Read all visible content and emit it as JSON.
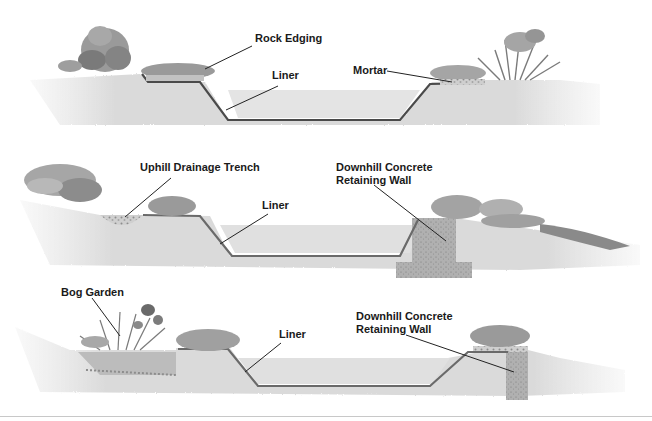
{
  "diagram": {
    "colors": {
      "soil": "#d8d8d8",
      "soil_dark": "#bdbdbd",
      "water": "#e6e6e6",
      "liner": "#4a4a4a",
      "rock": "#9a9a9a",
      "rock_light": "#b8b8b8",
      "concrete": "#a8a8a8",
      "plant": "#8a8a8a",
      "plant_dark": "#5e5e5e",
      "leader": "#222222",
      "rule": "#c8c8c8"
    },
    "panels": [
      {
        "id": "level-ground",
        "labels": [
          {
            "text": "Rock Edging"
          },
          {
            "text": "Liner"
          },
          {
            "text": "Mortar"
          }
        ]
      },
      {
        "id": "sloped-with-trench",
        "labels": [
          {
            "text": "Uphill Drainage Trench"
          },
          {
            "text": "Liner"
          },
          {
            "line1": "Downhill Concrete",
            "line2": "Retaining Wall"
          }
        ]
      },
      {
        "id": "sloped-with-bog-garden",
        "labels": [
          {
            "text": "Bog Garden"
          },
          {
            "text": "Liner"
          },
          {
            "line1": "Downhill Concrete",
            "line2": "Retaining Wall"
          }
        ]
      }
    ]
  }
}
